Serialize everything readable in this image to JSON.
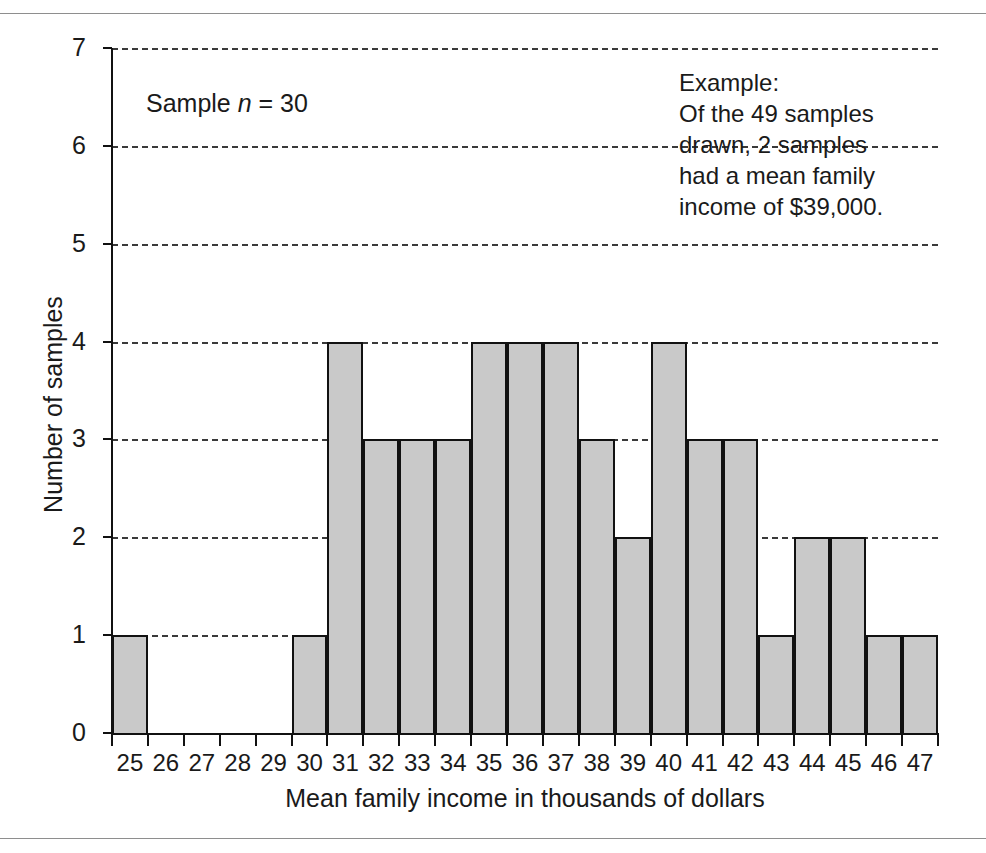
{
  "figure": {
    "has_top_rule": true,
    "has_bottom_rule": true
  },
  "annotations": {
    "sample_label_prefix": "Sample ",
    "sample_label_italic": "n",
    "sample_label_suffix": " = 30",
    "sample_note_full": "Sample n = 30",
    "example_note": "Example:\nOf the 49 samples\ndrawn, 2 samples\nhad a mean family\nincome of $39,000."
  },
  "colors": {
    "bar_fill": "#c9c9c9",
    "bar_edge": "#111111",
    "gridline": "#3a3a3a",
    "axis": "#111111",
    "text": "#1a1a1a",
    "rule": "#8e8e8e"
  },
  "chart_data": {
    "type": "bar",
    "title": "",
    "subtitle": "",
    "xlabel": "Mean family income in thousands of dollars",
    "ylabel": "Number of samples",
    "categories": [
      "25",
      "26",
      "27",
      "28",
      "29",
      "30",
      "31",
      "32",
      "33",
      "34",
      "35",
      "36",
      "37",
      "38",
      "39",
      "40",
      "41",
      "42",
      "43",
      "44",
      "45",
      "46",
      "47"
    ],
    "values": [
      1,
      0,
      0,
      0,
      0,
      1,
      4,
      3,
      3,
      3,
      4,
      4,
      4,
      3,
      2,
      4,
      3,
      3,
      1,
      2,
      2,
      1,
      1
    ],
    "ylim": [
      0,
      7
    ],
    "yticks": [
      0,
      1,
      2,
      3,
      4,
      5,
      6,
      7
    ],
    "ytick_labels": [
      "0",
      "1",
      "2",
      "3",
      "4",
      "5",
      "6",
      "7"
    ],
    "xtick_labels": [
      "25",
      "26",
      "27",
      "28",
      "29",
      "30",
      "31",
      "32",
      "33",
      "34",
      "35",
      "36",
      "37",
      "38",
      "39",
      "40",
      "41",
      "42",
      "43",
      "44",
      "45",
      "46",
      "47"
    ],
    "grid": "horizontal-dashed",
    "legend": "none",
    "sample_size": 30,
    "total_samples": 49,
    "annotations": [
      "Sample n = 30",
      "Example: Of the 49 samples drawn, 2 samples had a mean family income of $39,000."
    ]
  }
}
